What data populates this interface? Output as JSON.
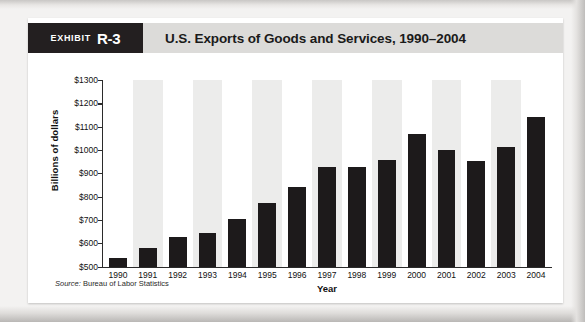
{
  "exhibit": {
    "badge_word": "Exhibit",
    "badge_number": "R-3",
    "title": "U.S. Exports of Goods and Services, 1990–2004",
    "source_label": "Source:",
    "source_text": "Bureau of Labor Statistics"
  },
  "colors": {
    "badge_background": "#231f20",
    "header_background": "#dcdbd9",
    "bar": "#1d1a1b",
    "band": "#ececeb",
    "axis": "#2b2b2b",
    "card": "#ffffff",
    "page": "#f3f2f1"
  },
  "chart_data": {
    "type": "bar",
    "title": "U.S. Exports of Goods and Services, 1990–2004",
    "xlabel": "Year",
    "ylabel": "Billions of dollars",
    "categories": [
      "1990",
      "1991",
      "1992",
      "1993",
      "1994",
      "1995",
      "1996",
      "1997",
      "1998",
      "1999",
      "2000",
      "2001",
      "2002",
      "2003",
      "2004"
    ],
    "values": [
      540,
      580,
      630,
      645,
      705,
      775,
      845,
      930,
      930,
      960,
      1070,
      1000,
      955,
      1015,
      1145
    ],
    "ylim": [
      500,
      1300
    ],
    "ytick_values": [
      1300,
      1200,
      1100,
      1000,
      900,
      800,
      700,
      600,
      500
    ],
    "ytick_labels": [
      "$1300",
      "$1200",
      "$1100",
      "$1000",
      "$900",
      "$800",
      "$700",
      "$600",
      "$500"
    ],
    "grid": false,
    "legend": null,
    "bands": "alternating light-gray vertical bands behind even-indexed categories"
  }
}
